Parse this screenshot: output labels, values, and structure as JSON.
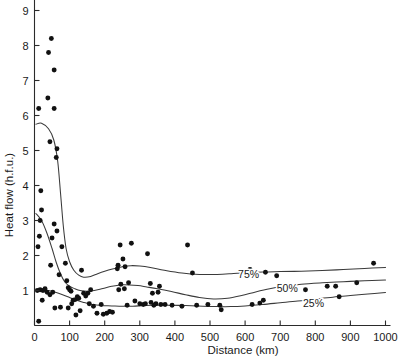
{
  "chart_data": {
    "type": "scatter",
    "title": "",
    "xlabel": "Distance  (km)",
    "ylabel": "Heat flow  (h.f.u.)",
    "xlim": [
      0,
      1000
    ],
    "ylim": [
      0,
      9.4
    ],
    "grid": false,
    "legend": "none",
    "xticks": [
      0,
      100,
      200,
      300,
      400,
      500,
      600,
      700,
      800,
      900,
      1000
    ],
    "xtick_labels": [
      "0",
      "100",
      "200",
      "300",
      "400",
      "500",
      "600",
      "700",
      "800",
      "900",
      "1000"
    ],
    "yticks": [
      1,
      2,
      3,
      4,
      5,
      6,
      7,
      8,
      9
    ],
    "ytick_labels": [
      "1",
      "2",
      "3",
      "4",
      "5",
      "6",
      "7",
      "8",
      "9"
    ],
    "points": [
      [
        12,
        6.2
      ],
      [
        18,
        3.85
      ],
      [
        20,
        3.3
      ],
      [
        16,
        3.0
      ],
      [
        14,
        2.55
      ],
      [
        10,
        2.25
      ],
      [
        8,
        1.0
      ],
      [
        16,
        1.02
      ],
      [
        24,
        1.0
      ],
      [
        30,
        1.05
      ],
      [
        36,
        0.95
      ],
      [
        22,
        0.72
      ],
      [
        12,
        0.12
      ],
      [
        40,
        7.8
      ],
      [
        48,
        8.2
      ],
      [
        56,
        7.3
      ],
      [
        38,
        6.5
      ],
      [
        56,
        6.2
      ],
      [
        44,
        5.25
      ],
      [
        64,
        5.05
      ],
      [
        62,
        4.8
      ],
      [
        56,
        2.9
      ],
      [
        64,
        2.7
      ],
      [
        50,
        2.5
      ],
      [
        46,
        1.72
      ],
      [
        52,
        0.95
      ],
      [
        44,
        0.88
      ],
      [
        58,
        0.5
      ],
      [
        74,
        0.52
      ],
      [
        70,
        1.45
      ],
      [
        78,
        2.25
      ],
      [
        88,
        1.78
      ],
      [
        92,
        1.28
      ],
      [
        96,
        1.08
      ],
      [
        100,
        1.02
      ],
      [
        104,
        0.98
      ],
      [
        96,
        0.5
      ],
      [
        106,
        0.62
      ],
      [
        110,
        0.72
      ],
      [
        116,
        0.74
      ],
      [
        122,
        0.82
      ],
      [
        126,
        0.78
      ],
      [
        130,
        0.42
      ],
      [
        118,
        0.3
      ],
      [
        134,
        1.58
      ],
      [
        140,
        0.92
      ],
      [
        146,
        0.84
      ],
      [
        152,
        0.92
      ],
      [
        160,
        1.02
      ],
      [
        156,
        0.62
      ],
      [
        168,
        0.55
      ],
      [
        178,
        0.35
      ],
      [
        190,
        0.6
      ],
      [
        196,
        0.32
      ],
      [
        206,
        0.35
      ],
      [
        214,
        0.4
      ],
      [
        222,
        0.38
      ],
      [
        236,
        1.62
      ],
      [
        238,
        1.72
      ],
      [
        244,
        2.3
      ],
      [
        252,
        1.9
      ],
      [
        258,
        1.68
      ],
      [
        246,
        1.18
      ],
      [
        240,
        1.02
      ],
      [
        256,
        1.05
      ],
      [
        268,
        1.22
      ],
      [
        264,
        0.58
      ],
      [
        276,
        2.35
      ],
      [
        286,
        0.7
      ],
      [
        300,
        0.62
      ],
      [
        310,
        0.6
      ],
      [
        316,
        0.62
      ],
      [
        322,
        2.05
      ],
      [
        330,
        1.2
      ],
      [
        336,
        0.92
      ],
      [
        332,
        0.66
      ],
      [
        340,
        0.58
      ],
      [
        346,
        0.62
      ],
      [
        352,
        0.95
      ],
      [
        356,
        1.12
      ],
      [
        360,
        0.6
      ],
      [
        372,
        0.6
      ],
      [
        392,
        0.58
      ],
      [
        420,
        0.55
      ],
      [
        436,
        2.3
      ],
      [
        450,
        1.5
      ],
      [
        462,
        0.58
      ],
      [
        494,
        0.6
      ],
      [
        528,
        0.58
      ],
      [
        532,
        0.45
      ],
      [
        614,
        1.6
      ],
      [
        620,
        0.6
      ],
      [
        642,
        0.64
      ],
      [
        652,
        0.72
      ],
      [
        658,
        1.52
      ],
      [
        690,
        1.42
      ],
      [
        772,
        1.02
      ],
      [
        834,
        1.12
      ],
      [
        858,
        1.12
      ],
      [
        868,
        0.82
      ],
      [
        918,
        1.22
      ],
      [
        966,
        1.78
      ]
    ],
    "curves": [
      {
        "name": "75%",
        "label": "75%",
        "label_x": 610,
        "label_y": 1.35,
        "points": [
          [
            4,
            5.75
          ],
          [
            20,
            5.78
          ],
          [
            40,
            5.62
          ],
          [
            55,
            5.3
          ],
          [
            66,
            4.7
          ],
          [
            74,
            3.8
          ],
          [
            82,
            2.85
          ],
          [
            90,
            2.2
          ],
          [
            100,
            1.82
          ],
          [
            112,
            1.58
          ],
          [
            126,
            1.44
          ],
          [
            140,
            1.38
          ],
          [
            160,
            1.4
          ],
          [
            180,
            1.48
          ],
          [
            200,
            1.55
          ],
          [
            225,
            1.62
          ],
          [
            250,
            1.68
          ],
          [
            275,
            1.71
          ],
          [
            300,
            1.7
          ],
          [
            330,
            1.66
          ],
          [
            370,
            1.58
          ],
          [
            420,
            1.5
          ],
          [
            470,
            1.46
          ],
          [
            520,
            1.46
          ],
          [
            560,
            1.48
          ],
          [
            600,
            1.51
          ],
          [
            650,
            1.53
          ],
          [
            700,
            1.54
          ],
          [
            760,
            1.55
          ],
          [
            820,
            1.57
          ],
          [
            880,
            1.6
          ],
          [
            940,
            1.63
          ],
          [
            1000,
            1.66
          ]
        ]
      },
      {
        "name": "50%",
        "label": "50%",
        "label_x": 720,
        "label_y": 0.95,
        "points": [
          [
            4,
            3.2
          ],
          [
            20,
            3.0
          ],
          [
            35,
            2.65
          ],
          [
            50,
            2.2
          ],
          [
            62,
            1.8
          ],
          [
            74,
            1.48
          ],
          [
            86,
            1.25
          ],
          [
            100,
            1.12
          ],
          [
            115,
            1.05
          ],
          [
            130,
            1.0
          ],
          [
            150,
            0.98
          ],
          [
            170,
            1.0
          ],
          [
            195,
            1.06
          ],
          [
            220,
            1.12
          ],
          [
            245,
            1.16
          ],
          [
            270,
            1.16
          ],
          [
            295,
            1.14
          ],
          [
            320,
            1.1
          ],
          [
            350,
            1.05
          ],
          [
            390,
            0.97
          ],
          [
            430,
            0.88
          ],
          [
            470,
            0.8
          ],
          [
            510,
            0.76
          ],
          [
            550,
            0.78
          ],
          [
            590,
            0.86
          ],
          [
            630,
            0.96
          ],
          [
            670,
            1.05
          ],
          [
            710,
            1.12
          ],
          [
            760,
            1.18
          ],
          [
            820,
            1.22
          ],
          [
            880,
            1.25
          ],
          [
            940,
            1.28
          ],
          [
            1000,
            1.3
          ]
        ]
      },
      {
        "name": "25%",
        "label": "25%",
        "label_x": 795,
        "label_y": 0.52,
        "points": [
          [
            4,
            1.0
          ],
          [
            20,
            1.02
          ],
          [
            40,
            1.0
          ],
          [
            60,
            0.95
          ],
          [
            80,
            0.88
          ],
          [
            100,
            0.8
          ],
          [
            120,
            0.72
          ],
          [
            140,
            0.66
          ],
          [
            165,
            0.6
          ],
          [
            190,
            0.57
          ],
          [
            220,
            0.56
          ],
          [
            250,
            0.55
          ],
          [
            280,
            0.55
          ],
          [
            310,
            0.57
          ],
          [
            340,
            0.58
          ],
          [
            380,
            0.58
          ],
          [
            430,
            0.57
          ],
          [
            480,
            0.55
          ],
          [
            520,
            0.54
          ],
          [
            560,
            0.54
          ],
          [
            600,
            0.56
          ],
          [
            650,
            0.6
          ],
          [
            700,
            0.65
          ],
          [
            750,
            0.7
          ],
          [
            800,
            0.76
          ],
          [
            850,
            0.81
          ],
          [
            900,
            0.86
          ],
          [
            950,
            0.9
          ],
          [
            1000,
            0.94
          ]
        ]
      }
    ]
  },
  "axes": {
    "x_title": "Distance  (km)",
    "y_title": "Heat flow  (h.f.u.)"
  }
}
